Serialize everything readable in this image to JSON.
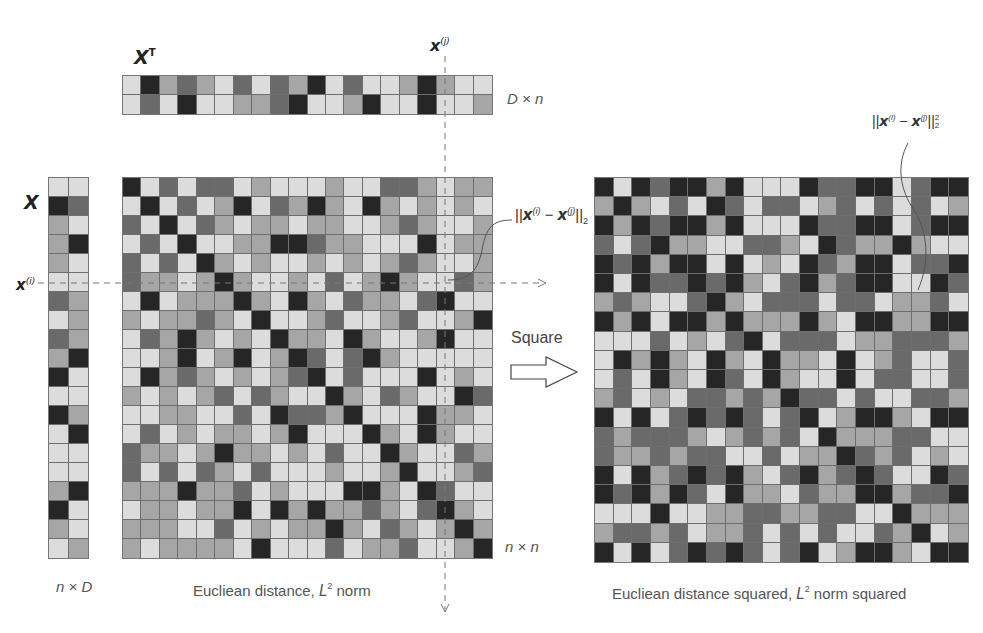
{
  "labels": {
    "xt_name": "X",
    "xt_sup": "T",
    "xt_dim": "D × n",
    "xj_name": "x",
    "xj_sup": "(j)",
    "x_name": "X",
    "xi_name": "x",
    "xi_sup": "(i)",
    "x_dim": "n × D",
    "nn_dim": "n × n",
    "dist_pre": "||",
    "dist_x1": "x",
    "dist_s1": "(i)",
    "dist_minus": " − ",
    "dist_x2": "x",
    "dist_s2": "(j)",
    "dist_post": "||",
    "dist_sub": "2",
    "sq_post": "||",
    "sq_sup": "2",
    "sq_sub": "2",
    "square_label": "Square",
    "caption_left_pre": "Eucliean distance, ",
    "caption_left_L": "L",
    "caption_left_sup": "2",
    "caption_left_post": " norm",
    "caption_right_pre": "Eucliean distance squared, ",
    "caption_right_L": "L",
    "caption_right_sup": "2",
    "caption_right_post": " norm squared"
  },
  "palette": [
    "#262626",
    "#6a6a6a",
    "#a6a6a6",
    "#dcdcdc"
  ],
  "matrices": {
    "xt": {
      "rows": 2,
      "cols": 20,
      "cells": [
        [
          3,
          0,
          2,
          1,
          2,
          3,
          1,
          3,
          1,
          2,
          0,
          3,
          1,
          3,
          3,
          2,
          0,
          2,
          3,
          3
        ],
        [
          3,
          1,
          3,
          0,
          3,
          3,
          2,
          2,
          1,
          0,
          3,
          3,
          2,
          0,
          3,
          3,
          0,
          3,
          3,
          2
        ]
      ]
    },
    "x": {
      "rows": 20,
      "cols": 2,
      "cells": [
        [
          3,
          3
        ],
        [
          0,
          1
        ],
        [
          2,
          3
        ],
        [
          2,
          0
        ],
        [
          2,
          3
        ],
        [
          3,
          3
        ],
        [
          1,
          2
        ],
        [
          3,
          2
        ],
        [
          1,
          2
        ],
        [
          2,
          0
        ],
        [
          0,
          3
        ],
        [
          3,
          3
        ],
        [
          0,
          2
        ],
        [
          3,
          0
        ],
        [
          3,
          3
        ],
        [
          3,
          3
        ],
        [
          2,
          0
        ],
        [
          0,
          3
        ],
        [
          2,
          3
        ],
        [
          3,
          2
        ]
      ]
    },
    "distance": {
      "rows": 20,
      "cols": 20,
      "cells": [
        [
          0,
          3,
          1,
          3,
          1,
          1,
          3,
          2,
          3,
          3,
          3,
          2,
          3,
          3,
          1,
          1,
          2,
          3,
          2,
          2
        ],
        [
          3,
          0,
          3,
          1,
          3,
          2,
          0,
          3,
          1,
          2,
          0,
          2,
          3,
          0,
          2,
          3,
          2,
          3,
          2,
          3
        ],
        [
          1,
          3,
          0,
          3,
          1,
          2,
          3,
          2,
          2,
          3,
          2,
          2,
          3,
          3,
          2,
          1,
          2,
          3,
          3,
          2
        ],
        [
          3,
          1,
          3,
          0,
          3,
          3,
          2,
          2,
          0,
          0,
          1,
          2,
          2,
          3,
          3,
          3,
          0,
          3,
          2,
          2
        ],
        [
          1,
          3,
          1,
          3,
          0,
          2,
          3,
          2,
          3,
          3,
          2,
          3,
          2,
          3,
          2,
          1,
          2,
          3,
          3,
          2
        ],
        [
          1,
          2,
          2,
          3,
          2,
          0,
          2,
          3,
          3,
          2,
          3,
          1,
          3,
          2,
          0,
          2,
          3,
          3,
          1,
          2
        ],
        [
          3,
          0,
          3,
          2,
          2,
          2,
          0,
          2,
          3,
          0,
          2,
          3,
          1,
          2,
          2,
          3,
          1,
          0,
          3,
          3
        ],
        [
          2,
          3,
          2,
          2,
          1,
          2,
          3,
          0,
          3,
          3,
          2,
          1,
          3,
          3,
          2,
          1,
          3,
          3,
          2,
          0
        ],
        [
          3,
          1,
          2,
          0,
          2,
          3,
          2,
          3,
          0,
          2,
          2,
          3,
          0,
          2,
          3,
          3,
          2,
          0,
          3,
          3
        ],
        [
          3,
          3,
          2,
          0,
          3,
          2,
          0,
          3,
          2,
          0,
          1,
          3,
          1,
          0,
          2,
          3,
          3,
          3,
          3,
          3
        ],
        [
          3,
          0,
          2,
          1,
          2,
          3,
          2,
          3,
          2,
          1,
          0,
          3,
          1,
          3,
          3,
          3,
          0,
          3,
          2,
          3
        ],
        [
          2,
          3,
          2,
          3,
          2,
          1,
          3,
          1,
          2,
          3,
          3,
          0,
          2,
          3,
          1,
          2,
          3,
          3,
          0,
          1
        ],
        [
          3,
          3,
          2,
          2,
          3,
          3,
          1,
          3,
          0,
          1,
          1,
          2,
          0,
          3,
          3,
          3,
          0,
          2,
          2,
          3
        ],
        [
          3,
          1,
          3,
          2,
          3,
          2,
          2,
          3,
          2,
          0,
          3,
          3,
          3,
          0,
          2,
          3,
          0,
          2,
          3,
          3
        ],
        [
          1,
          2,
          2,
          3,
          2,
          0,
          2,
          2,
          3,
          2,
          3,
          1,
          3,
          3,
          0,
          2,
          3,
          3,
          1,
          2
        ],
        [
          1,
          3,
          1,
          3,
          1,
          2,
          3,
          1,
          3,
          3,
          3,
          2,
          3,
          3,
          2,
          0,
          3,
          3,
          2,
          1
        ],
        [
          2,
          2,
          2,
          0,
          2,
          2,
          1,
          3,
          2,
          3,
          3,
          3,
          0,
          0,
          2,
          3,
          0,
          1,
          3,
          3
        ],
        [
          3,
          2,
          2,
          3,
          2,
          2,
          0,
          3,
          0,
          2,
          0,
          2,
          2,
          1,
          2,
          3,
          1,
          0,
          2,
          3
        ],
        [
          2,
          2,
          2,
          3,
          3,
          1,
          3,
          2,
          3,
          2,
          2,
          0,
          2,
          3,
          1,
          2,
          3,
          2,
          0,
          2
        ],
        [
          2,
          3,
          2,
          2,
          2,
          2,
          3,
          0,
          3,
          3,
          3,
          1,
          3,
          2,
          2,
          1,
          3,
          3,
          2,
          0
        ]
      ]
    },
    "squared": {
      "rows": 20,
      "cols": 20,
      "cells": [
        [
          0,
          3,
          0,
          1,
          0,
          0,
          2,
          0,
          3,
          3,
          3,
          0,
          1,
          1,
          0,
          0,
          3,
          1,
          0,
          0
        ],
        [
          2,
          0,
          2,
          3,
          1,
          3,
          0,
          1,
          3,
          1,
          1,
          3,
          2,
          1,
          3,
          1,
          3,
          1,
          3,
          2
        ],
        [
          0,
          2,
          0,
          1,
          0,
          0,
          2,
          0,
          3,
          3,
          3,
          0,
          1,
          1,
          0,
          0,
          3,
          1,
          0,
          0
        ],
        [
          1,
          3,
          1,
          0,
          2,
          2,
          3,
          3,
          1,
          1,
          2,
          3,
          0,
          1,
          2,
          2,
          0,
          2,
          3,
          3
        ],
        [
          0,
          1,
          0,
          2,
          0,
          0,
          3,
          0,
          3,
          2,
          3,
          0,
          1,
          2,
          0,
          0,
          3,
          1,
          1,
          0
        ],
        [
          0,
          3,
          0,
          1,
          1,
          0,
          1,
          0,
          2,
          3,
          1,
          0,
          2,
          1,
          0,
          0,
          3,
          3,
          0,
          1
        ],
        [
          2,
          1,
          2,
          3,
          3,
          1,
          0,
          2,
          3,
          1,
          1,
          1,
          3,
          1,
          1,
          3,
          2,
          2,
          1,
          3
        ],
        [
          0,
          2,
          0,
          3,
          0,
          0,
          2,
          0,
          2,
          2,
          2,
          0,
          2,
          3,
          0,
          0,
          2,
          2,
          0,
          0
        ],
        [
          3,
          3,
          3,
          1,
          3,
          2,
          3,
          1,
          0,
          3,
          1,
          1,
          1,
          3,
          2,
          2,
          1,
          1,
          1,
          2
        ],
        [
          3,
          0,
          2,
          0,
          2,
          3,
          0,
          2,
          3,
          0,
          2,
          2,
          3,
          0,
          3,
          2,
          1,
          3,
          3,
          1
        ],
        [
          3,
          1,
          3,
          0,
          2,
          3,
          0,
          1,
          3,
          0,
          2,
          3,
          3,
          0,
          3,
          1,
          1,
          3,
          3,
          1
        ],
        [
          2,
          1,
          3,
          2,
          3,
          1,
          1,
          2,
          1,
          2,
          0,
          1,
          1,
          3,
          1,
          3,
          3,
          1,
          1,
          2
        ],
        [
          0,
          3,
          0,
          3,
          1,
          0,
          1,
          0,
          1,
          3,
          1,
          0,
          3,
          2,
          0,
          0,
          2,
          3,
          0,
          0
        ],
        [
          1,
          2,
          1,
          1,
          1,
          2,
          3,
          2,
          1,
          2,
          1,
          3,
          0,
          2,
          2,
          2,
          1,
          1,
          3,
          3
        ],
        [
          1,
          2,
          2,
          1,
          2,
          1,
          1,
          3,
          3,
          1,
          3,
          2,
          2,
          0,
          1,
          2,
          1,
          3,
          2,
          3
        ],
        [
          0,
          3,
          0,
          2,
          1,
          0,
          1,
          0,
          2,
          3,
          1,
          0,
          2,
          1,
          0,
          1,
          3,
          3,
          0,
          1
        ],
        [
          0,
          1,
          0,
          2,
          0,
          1,
          3,
          0,
          2,
          2,
          3,
          1,
          2,
          2,
          0,
          0,
          2,
          1,
          1,
          0
        ],
        [
          3,
          3,
          3,
          0,
          3,
          3,
          2,
          2,
          1,
          1,
          2,
          2,
          1,
          1,
          3,
          3,
          0,
          2,
          2,
          2
        ],
        [
          2,
          1,
          1,
          2,
          1,
          3,
          2,
          2,
          1,
          3,
          1,
          3,
          1,
          3,
          3,
          1,
          2,
          0,
          3,
          2
        ],
        [
          0,
          3,
          0,
          3,
          1,
          0,
          1,
          0,
          1,
          3,
          1,
          0,
          3,
          2,
          0,
          0,
          2,
          3,
          0,
          0
        ]
      ]
    }
  }
}
